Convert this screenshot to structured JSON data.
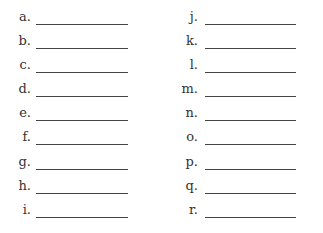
{
  "left_column": [
    {
      "label": "a."
    },
    {
      "label": "b."
    },
    {
      "label": "c."
    },
    {
      "label": "d."
    },
    {
      "label": "e."
    },
    {
      "label": "f."
    },
    {
      "label": "g."
    },
    {
      "label": "h."
    },
    {
      "label": "i."
    }
  ],
  "right_column": [
    {
      "label": "j."
    },
    {
      "label": "k."
    },
    {
      "label": "l."
    },
    {
      "label": "m."
    },
    {
      "label": "n."
    },
    {
      "label": "o."
    },
    {
      "label": "p."
    },
    {
      "label": "q."
    },
    {
      "label": "r."
    }
  ]
}
